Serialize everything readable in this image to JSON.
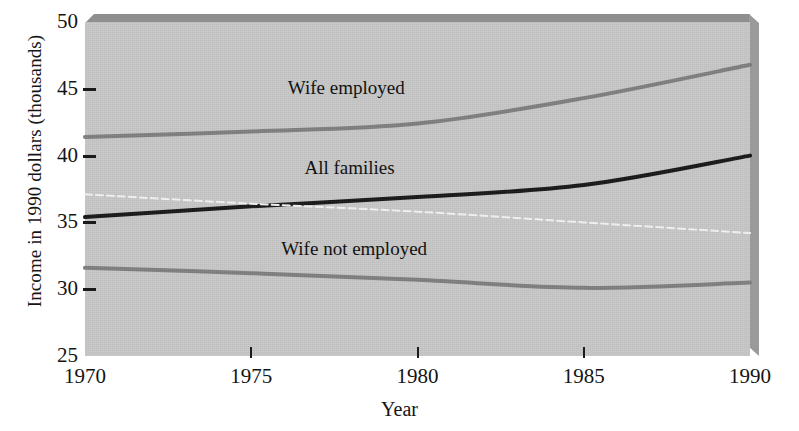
{
  "chart_data": {
    "type": "line",
    "title": "",
    "xlabel": "Year",
    "ylabel": "Income in 1990 dollars (thousands)",
    "xlim": [
      1970,
      1990
    ],
    "ylim": [
      25,
      50
    ],
    "xticks": [
      1970,
      1975,
      1980,
      1985,
      1990
    ],
    "xtick_labels": [
      "1970",
      "1975",
      "1980",
      "1985",
      "1990"
    ],
    "yticks": [
      25,
      30,
      35,
      40,
      45,
      50
    ],
    "ytick_labels": [
      "25",
      "30",
      "35",
      "40",
      "45",
      "50"
    ],
    "grid": false,
    "legend": "inline-annotations",
    "plot_background": "#c6c6c6",
    "x": [
      1970,
      1975,
      1980,
      1985,
      1990
    ],
    "series": [
      {
        "name": "Wife employed",
        "color": "#7d7d7d",
        "style": "solid",
        "width": 4,
        "values": [
          41.4,
          41.8,
          42.4,
          44.3,
          46.8
        ]
      },
      {
        "name": "All families",
        "color": "#151515",
        "style": "solid",
        "width": 4,
        "values": [
          35.4,
          36.2,
          36.9,
          37.8,
          40.0
        ]
      },
      {
        "name": "",
        "color": "#f2f2f2",
        "style": "dashed",
        "width": 2,
        "values": [
          37.1,
          36.4,
          35.8,
          35.0,
          34.2
        ]
      },
      {
        "name": "Wife not employed",
        "color": "#7d7d7d",
        "style": "solid",
        "width": 4,
        "values": [
          31.6,
          31.2,
          30.7,
          30.1,
          30.5
        ]
      }
    ],
    "annotations": [
      {
        "text": "Wife employed",
        "x": 1976.1,
        "y": 45.0
      },
      {
        "text": "All families",
        "x": 1976.6,
        "y": 39.0
      },
      {
        "text": "Wife not employed",
        "x": 1975.9,
        "y": 32.9
      }
    ]
  },
  "axis": {
    "y_title": "Income in 1990 dollars (thousands)",
    "x_title": "Year",
    "y_labels": [
      "50",
      "45",
      "40",
      "35",
      "30",
      "25"
    ],
    "x_labels": [
      "1970",
      "1975",
      "1980",
      "1985",
      "1990"
    ]
  },
  "annotations": {
    "wife_employed": "Wife employed",
    "all_families": "All families",
    "wife_not_employed": "Wife not employed"
  }
}
